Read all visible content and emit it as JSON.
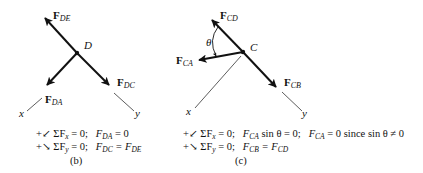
{
  "figure_b": {
    "node": "D",
    "forces": {
      "de": {
        "sym": "F",
        "sub": "DE"
      },
      "dc": {
        "sym": "F",
        "sub": "DC"
      },
      "da": {
        "sym": "F",
        "sub": "DA"
      }
    },
    "axes": {
      "x": "x",
      "y": "y"
    },
    "equations": [
      {
        "prefix": "+↙ ΣF",
        "sub": "x",
        "rest": " = 0;",
        "result_l": "F",
        "result_lsub": "DA",
        "result_r": " = 0",
        "result_rsub": ""
      },
      {
        "prefix": "+↘ ΣF",
        "sub": "y",
        "rest": " = 0;",
        "result_l": "F",
        "result_lsub": "DC",
        "result_r": " = F",
        "result_rsub": "DE"
      }
    ],
    "caption": "(b)"
  },
  "figure_c": {
    "node": "C",
    "angle": "θ",
    "forces": {
      "cd": {
        "sym": "F",
        "sub": "CD"
      },
      "ca": {
        "sym": "F",
        "sub": "CA"
      },
      "cb": {
        "sym": "F",
        "sub": "CB"
      }
    },
    "axes": {
      "x": "x",
      "y": "y"
    },
    "equations": [
      {
        "prefix": "+↙ ΣF",
        "sub": "x",
        "rest": " = 0;",
        "p1": "F",
        "p1sub": "CA",
        "p1rest": " sin θ = 0;",
        "p2": "F",
        "p2sub": "CA",
        "p2rest": " = 0 since sin θ ≠ 0"
      },
      {
        "prefix": "+↘ ΣF",
        "sub": "y",
        "rest": " = 0;",
        "p1": "F",
        "p1sub": "CB",
        "p1rest": " = F",
        "p1end": "CD"
      }
    ],
    "caption": "(c)"
  },
  "colors": {
    "ink": "#111111",
    "axis": "#333333",
    "background": "#ffffff"
  }
}
